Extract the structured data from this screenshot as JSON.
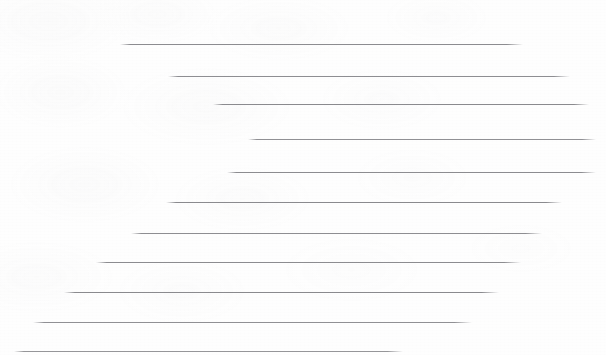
{
  "page": {
    "width": 606,
    "height": 355,
    "background_color": "#fefefe",
    "texture": "faint grayscale scanner mottling"
  },
  "lines": {
    "count": 11,
    "color": "#8a8a8e",
    "thickness_px": 1,
    "arrangement": "left-descending staircase of horizontal rules",
    "items": [
      {
        "index": 1,
        "name": "rule-line-1",
        "x1": 120,
        "x2": 523,
        "y": 44,
        "length": 403,
        "color": "#8c8c90",
        "thickness": 1
      },
      {
        "index": 2,
        "name": "rule-line-2",
        "x1": 168,
        "x2": 570,
        "y": 76,
        "length": 402,
        "color": "#8e8e92",
        "thickness": 1
      },
      {
        "index": 3,
        "name": "rule-line-3",
        "x1": 213,
        "x2": 589,
        "y": 104,
        "length": 376,
        "color": "#8a8a8e",
        "thickness": 1
      },
      {
        "index": 4,
        "name": "rule-line-4",
        "x1": 248,
        "x2": 596,
        "y": 139,
        "length": 348,
        "color": "#909094",
        "thickness": 1
      },
      {
        "index": 5,
        "name": "rule-line-5",
        "x1": 227,
        "x2": 596,
        "y": 172,
        "length": 369,
        "color": "#8c8c90",
        "thickness": 1
      },
      {
        "index": 6,
        "name": "rule-line-6",
        "x1": 166,
        "x2": 562,
        "y": 202,
        "length": 396,
        "color": "#8a8a8e",
        "thickness": 1
      },
      {
        "index": 7,
        "name": "rule-line-7",
        "x1": 131,
        "x2": 542,
        "y": 233,
        "length": 411,
        "color": "#8e8e92",
        "thickness": 1
      },
      {
        "index": 8,
        "name": "rule-line-8",
        "x1": 96,
        "x2": 521,
        "y": 262,
        "length": 425,
        "color": "#8c8c90",
        "thickness": 1
      },
      {
        "index": 9,
        "name": "rule-line-9",
        "x1": 64,
        "x2": 499,
        "y": 292,
        "length": 435,
        "color": "#8a8a8e",
        "thickness": 1
      },
      {
        "index": 10,
        "name": "rule-line-10",
        "x1": 33,
        "x2": 472,
        "y": 322,
        "length": 439,
        "color": "#909094",
        "thickness": 1
      },
      {
        "index": 11,
        "name": "rule-line-11",
        "x1": 14,
        "x2": 403,
        "y": 351,
        "length": 389,
        "color": "#969699",
        "thickness": 1
      }
    ]
  }
}
